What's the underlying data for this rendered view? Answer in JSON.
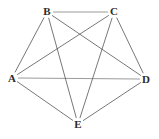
{
  "figure": {
    "background_color": "#ffffff",
    "width": 159,
    "height": 139
  },
  "graph": {
    "type": "undirected-simple-graph",
    "vertex_count": 5,
    "edge_count": 10,
    "vertex_radius": 0,
    "vertices": [
      {
        "id": "A",
        "label": "A",
        "x": 12,
        "y": 78,
        "label_x": 12,
        "label_y": 78
      },
      {
        "id": "B",
        "label": "B",
        "x": 47,
        "y": 12,
        "label_x": 47,
        "label_y": 11
      },
      {
        "id": "C",
        "label": "C",
        "x": 114,
        "y": 12,
        "label_x": 114,
        "label_y": 11
      },
      {
        "id": "D",
        "label": "D",
        "x": 146,
        "y": 79,
        "label_x": 146,
        "label_y": 79
      },
      {
        "id": "E",
        "label": "E",
        "x": 78,
        "y": 124,
        "label_x": 78,
        "label_y": 124
      }
    ],
    "edges": [
      {
        "id": "AB",
        "from": "A",
        "to": "B",
        "color": "#555555",
        "width": 0.8
      },
      {
        "id": "AC",
        "from": "A",
        "to": "C",
        "color": "#555555",
        "width": 0.8
      },
      {
        "id": "AD",
        "from": "A",
        "to": "D",
        "color": "#9b9b9b",
        "width": 1.1
      },
      {
        "id": "AE",
        "from": "A",
        "to": "E",
        "color": "#555555",
        "width": 0.8
      },
      {
        "id": "BC",
        "from": "B",
        "to": "C",
        "color": "#9b9b9b",
        "width": 1.1
      },
      {
        "id": "BD",
        "from": "B",
        "to": "D",
        "color": "#555555",
        "width": 0.8
      },
      {
        "id": "BE",
        "from": "B",
        "to": "E",
        "color": "#555555",
        "width": 0.8
      },
      {
        "id": "CD",
        "from": "C",
        "to": "D",
        "color": "#555555",
        "width": 0.8
      },
      {
        "id": "CE",
        "from": "C",
        "to": "E",
        "color": "#555555",
        "width": 0.8
      },
      {
        "id": "DE",
        "from": "D",
        "to": "E",
        "color": "#555555",
        "width": 0.8
      }
    ]
  }
}
